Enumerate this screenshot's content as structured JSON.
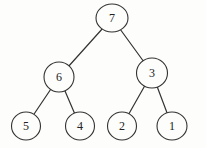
{
  "diagram": {
    "type": "binary-tree",
    "background_color": "#fdfdfc",
    "node_fill_color": "#fdfdfc",
    "stroke_color": "#333333",
    "text_color": "#222222",
    "nodes": [
      {
        "id": "7",
        "label": "7",
        "x": 112,
        "y": 18,
        "rx": 16,
        "ry": 14
      },
      {
        "id": "6",
        "label": "6",
        "x": 59,
        "y": 77,
        "rx": 15,
        "ry": 15
      },
      {
        "id": "3",
        "label": "3",
        "x": 152,
        "y": 73,
        "rx": 15.5,
        "ry": 15
      },
      {
        "id": "5",
        "label": "5",
        "x": 26,
        "y": 126,
        "rx": 14.5,
        "ry": 14
      },
      {
        "id": "4",
        "label": "4",
        "x": 80,
        "y": 126,
        "rx": 14.5,
        "ry": 14
      },
      {
        "id": "2",
        "label": "2",
        "x": 122,
        "y": 126,
        "rx": 14.5,
        "ry": 14
      },
      {
        "id": "1",
        "label": "1",
        "x": 172,
        "y": 126,
        "rx": 15,
        "ry": 14
      }
    ],
    "edges": [
      {
        "from": "7",
        "to": "6"
      },
      {
        "from": "7",
        "to": "3"
      },
      {
        "from": "6",
        "to": "5"
      },
      {
        "from": "6",
        "to": "4"
      },
      {
        "from": "3",
        "to": "2"
      },
      {
        "from": "3",
        "to": "1"
      }
    ]
  }
}
